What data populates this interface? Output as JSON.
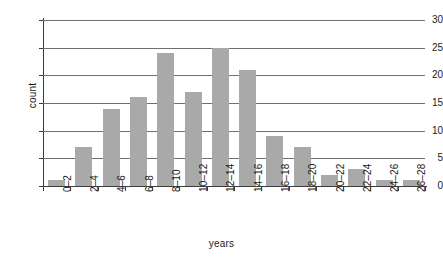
{
  "chart_data": {
    "type": "bar",
    "title": "",
    "subtitle": "",
    "xlabel": "years",
    "ylabel": "count",
    "categories": [
      "0–2",
      "2–4",
      "4–6",
      "6–8",
      "8–10",
      "10–12",
      "12–14",
      "14–16",
      "16–18",
      "18–20",
      "20–22",
      "22–24",
      "24–26",
      "26–28"
    ],
    "values": [
      1,
      7,
      14,
      16,
      24,
      17,
      25,
      21,
      9,
      7,
      2,
      3,
      1,
      1
    ],
    "ylim": [
      0,
      30
    ],
    "yticks": [
      0,
      5,
      10,
      15,
      20,
      25,
      30
    ],
    "ytick_labels": [
      "0",
      "5",
      "10",
      "15",
      "20",
      "25",
      "30"
    ],
    "grid": true,
    "grid_axis": "y",
    "legend": false,
    "legend_position": "none",
    "bar_color": "#a9a9a9",
    "axis_color": "#3b3b3b",
    "grid_color": "#6f6f6f",
    "background_color": "#ffffff"
  }
}
